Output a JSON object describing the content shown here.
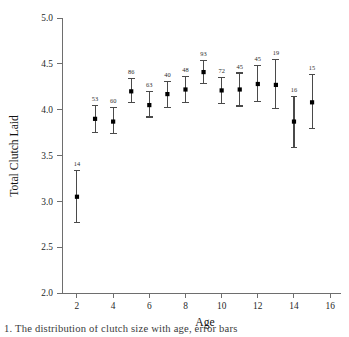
{
  "chart_data": {
    "type": "scatter",
    "title": "",
    "xlabel": "Age",
    "ylabel": "Total Clutch Laid",
    "xlim": [
      1.2,
      16.6
    ],
    "ylim": [
      2.0,
      5.0
    ],
    "grid": false,
    "legend": null,
    "x_ticks": [
      2,
      4,
      6,
      8,
      10,
      12,
      14,
      16
    ],
    "x_tick_labels": [
      "2",
      "4",
      "6",
      "8",
      "10",
      "12",
      "14",
      "16"
    ],
    "y_ticks": [
      2.0,
      2.5,
      3.0,
      3.5,
      4.0,
      4.5,
      5.0
    ],
    "y_tick_labels": [
      "2.0",
      "2.5",
      "3.0",
      "3.5",
      "4.0",
      "4.5",
      "5.0"
    ],
    "marker_style": "filled-square",
    "error_bar_style": "capped-vertical",
    "point_label_note": "sample size n above each error bar",
    "x": [
      2,
      3,
      4,
      5,
      6,
      7,
      8,
      9,
      10,
      11,
      12,
      13,
      14,
      15
    ],
    "values": [
      3.05,
      3.9,
      3.87,
      4.2,
      4.05,
      4.17,
      4.22,
      4.41,
      4.21,
      4.22,
      4.28,
      4.27,
      3.87,
      4.08
    ],
    "error_low": [
      2.77,
      3.75,
      3.74,
      4.08,
      3.92,
      4.02,
      4.08,
      4.29,
      4.07,
      4.04,
      4.09,
      4.01,
      3.59,
      3.79
    ],
    "error_high": [
      3.34,
      4.05,
      4.02,
      4.34,
      4.2,
      4.31,
      4.36,
      4.54,
      4.35,
      4.4,
      4.48,
      4.55,
      4.14,
      4.38
    ],
    "point_labels": [
      "14",
      "53",
      "60",
      "86",
      "63",
      "40",
      "48",
      "93",
      "72",
      "45",
      "45",
      "19",
      "16",
      "15"
    ],
    "points": [
      {
        "age": 2,
        "mean": 3.05,
        "low": 2.77,
        "high": 3.34,
        "n": "14"
      },
      {
        "age": 3,
        "mean": 3.9,
        "low": 3.75,
        "high": 4.05,
        "n": "53"
      },
      {
        "age": 4,
        "mean": 3.87,
        "low": 3.74,
        "high": 4.02,
        "n": "60"
      },
      {
        "age": 5,
        "mean": 4.2,
        "low": 4.08,
        "high": 4.34,
        "n": "86"
      },
      {
        "age": 6,
        "mean": 4.05,
        "low": 3.92,
        "high": 4.2,
        "n": "63"
      },
      {
        "age": 7,
        "mean": 4.17,
        "low": 4.02,
        "high": 4.31,
        "n": "40"
      },
      {
        "age": 8,
        "mean": 4.22,
        "low": 4.08,
        "high": 4.36,
        "n": "48"
      },
      {
        "age": 9,
        "mean": 4.41,
        "low": 4.29,
        "high": 4.54,
        "n": "93"
      },
      {
        "age": 10,
        "mean": 4.21,
        "low": 4.07,
        "high": 4.35,
        "n": "72"
      },
      {
        "age": 11,
        "mean": 4.22,
        "low": 4.04,
        "high": 4.4,
        "n": "45"
      },
      {
        "age": 12,
        "mean": 4.28,
        "low": 4.09,
        "high": 4.48,
        "n": "45"
      },
      {
        "age": 13,
        "mean": 4.27,
        "low": 4.01,
        "high": 4.55,
        "n": "19"
      },
      {
        "age": 14,
        "mean": 3.87,
        "low": 3.59,
        "high": 4.14,
        "n": "16"
      },
      {
        "age": 15,
        "mean": 4.08,
        "low": 3.79,
        "high": 4.38,
        "n": "15"
      }
    ],
    "colors": {
      "marker": "#000000",
      "error_bar": "#4a4a4a",
      "axis": "#6e6e6e",
      "text": "#1a1a1a",
      "background": "#ffffff"
    }
  },
  "caption": {
    "text": "1.  The distribution of clutch size with age, error bars"
  }
}
